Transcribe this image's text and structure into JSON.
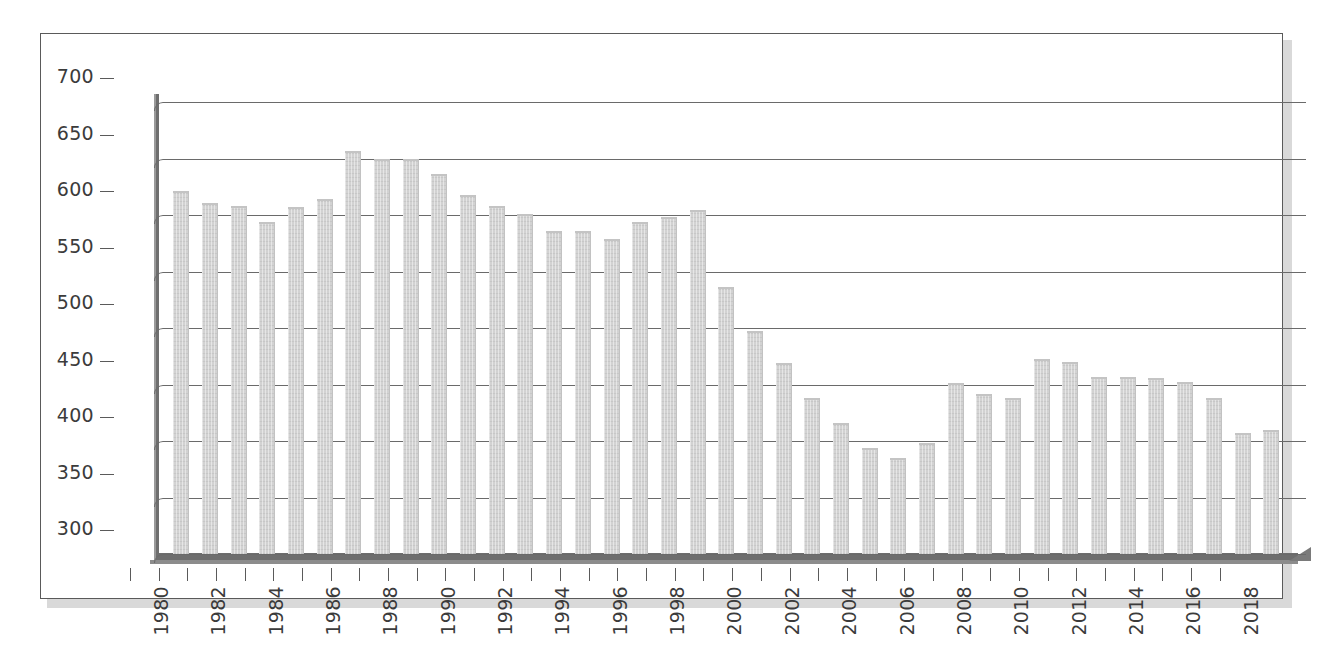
{
  "chart_data": {
    "type": "bar",
    "title": "",
    "subtitle": "",
    "xlabel": "",
    "ylabel": "",
    "ylim": [
      300,
      700
    ],
    "ytick_step": 50,
    "ytick_labels": [
      "300",
      "350",
      "400",
      "450",
      "500",
      "550",
      "600",
      "650",
      "700"
    ],
    "grid": true,
    "legend": false,
    "legend_position": "none",
    "style": "3d-column",
    "bar_color": "#d2d2d2",
    "axis_color": "#6e6e6e",
    "gridline_color": "#6a6a6a",
    "label_every_n_categories": 2,
    "categories": [
      "1980",
      "1981",
      "1982",
      "1983",
      "1984",
      "1985",
      "1986",
      "1987",
      "1988",
      "1989",
      "1990",
      "1991",
      "1992",
      "1993",
      "1994",
      "1995",
      "1996",
      "1997",
      "1998",
      "1999",
      "2000",
      "2001",
      "2002",
      "2003",
      "2004",
      "2005",
      "2006",
      "2007",
      "2008",
      "2009",
      "2010",
      "2011",
      "2012",
      "2013",
      "2014",
      "2015",
      "2016",
      "2017",
      "2018"
    ],
    "visible_tick_labels": [
      "1980",
      "1982",
      "1984",
      "1986",
      "1988",
      "1990",
      "1992",
      "1994",
      "1996",
      "1998",
      "2000",
      "2002",
      "2004",
      "2006",
      "2008",
      "2010",
      "2012",
      "2014",
      "2016",
      "2018"
    ],
    "values": [
      621,
      611,
      608,
      594,
      607,
      614,
      657,
      650,
      650,
      636,
      618,
      608,
      601,
      586,
      586,
      579,
      594,
      598,
      604,
      536,
      497,
      469,
      438,
      416,
      394,
      385,
      398,
      451,
      442,
      438,
      473,
      470,
      457,
      457,
      456,
      452,
      438,
      407,
      410
    ]
  }
}
